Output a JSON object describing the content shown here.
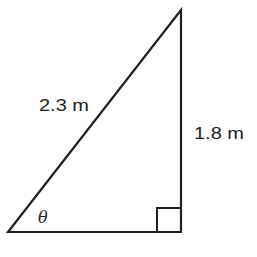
{
  "diagram": {
    "type": "right-triangle",
    "stroke_color": "#231f20",
    "background": "#ffffff",
    "hypotenuse": {
      "label": "2.3 m"
    },
    "opposite_side": {
      "label": "1.8 m"
    },
    "angle": {
      "label": "θ"
    },
    "right_angle_marker": true
  }
}
